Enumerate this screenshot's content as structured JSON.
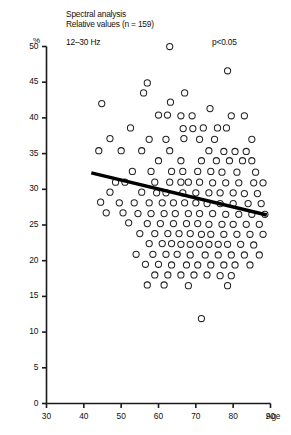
{
  "figure": {
    "title_line1": "Spectral analysis",
    "title_line2": "Relative values (n = 159)",
    "band_label": "12–30 Hz",
    "pvalue_label": "p<0.05",
    "yaxis_unit": "%",
    "xaxis_title": "Age",
    "marker_color": "#222222",
    "axis_color": "#1a1a1a",
    "fit_line_color": "#000000",
    "background": "#ffffff"
  },
  "chart_data": {
    "type": "scatter",
    "title": "Spectral analysis Relative values (n = 159)",
    "subtitle": "12–30 Hz",
    "annotation": "p<0.05",
    "xlabel": "Age",
    "ylabel": "%",
    "xlim": [
      30,
      90
    ],
    "ylim": [
      0,
      50
    ],
    "xticks": [
      30,
      40,
      50,
      60,
      70,
      80,
      90
    ],
    "yticks": [
      0,
      5,
      10,
      15,
      20,
      25,
      30,
      35,
      40,
      45,
      50
    ],
    "grid": false,
    "legend": "none",
    "n": 159,
    "marker": "open-circle",
    "fit_line": {
      "label": "linear regression",
      "x": [
        42.0,
        89.0
      ],
      "y": [
        32.3,
        26.4
      ]
    },
    "points": [
      [
        63.0,
        50.0
      ],
      [
        78.5,
        46.6
      ],
      [
        57.0,
        44.9
      ],
      [
        44.8,
        42.0
      ],
      [
        56.0,
        43.5
      ],
      [
        63.2,
        42.2
      ],
      [
        67.0,
        43.5
      ],
      [
        73.8,
        41.3
      ],
      [
        60.0,
        40.4
      ],
      [
        62.4,
        40.4
      ],
      [
        66.0,
        40.3
      ],
      [
        69.0,
        40.3
      ],
      [
        79.5,
        40.3
      ],
      [
        83.0,
        40.3
      ],
      [
        52.5,
        38.6
      ],
      [
        66.6,
        38.5
      ],
      [
        69.2,
        38.5
      ],
      [
        75.8,
        38.6
      ],
      [
        78.2,
        38.6
      ],
      [
        72.0,
        38.6
      ],
      [
        47.0,
        37.1
      ],
      [
        57.5,
        37.0
      ],
      [
        62.0,
        37.0
      ],
      [
        66.8,
        37.1
      ],
      [
        71.0,
        37.0
      ],
      [
        75.0,
        37.0
      ],
      [
        85.0,
        37.0
      ],
      [
        44.0,
        35.4
      ],
      [
        50.0,
        35.4
      ],
      [
        55.5,
        35.4
      ],
      [
        63.0,
        35.4
      ],
      [
        73.5,
        35.4
      ],
      [
        77.5,
        35.3
      ],
      [
        80.5,
        35.3
      ],
      [
        83.5,
        35.3
      ],
      [
        60.0,
        34.0
      ],
      [
        66.0,
        34.0
      ],
      [
        71.5,
        34.0
      ],
      [
        75.5,
        34.0
      ],
      [
        79.0,
        34.0
      ],
      [
        82.5,
        34.0
      ],
      [
        85.0,
        34.0
      ],
      [
        53.0,
        32.5
      ],
      [
        58.0,
        32.5
      ],
      [
        63.5,
        32.5
      ],
      [
        66.5,
        32.5
      ],
      [
        70.5,
        32.5
      ],
      [
        74.0,
        32.5
      ],
      [
        77.0,
        32.4
      ],
      [
        81.0,
        32.4
      ],
      [
        86.0,
        32.4
      ],
      [
        48.5,
        31.0
      ],
      [
        51.0,
        31.0
      ],
      [
        59.0,
        31.0
      ],
      [
        63.0,
        31.0
      ],
      [
        66.0,
        31.0
      ],
      [
        68.0,
        31.0
      ],
      [
        71.0,
        31.0
      ],
      [
        74.5,
        30.9
      ],
      [
        78.0,
        30.9
      ],
      [
        81.5,
        30.9
      ],
      [
        85.5,
        30.9
      ],
      [
        88.0,
        30.9
      ],
      [
        47.0,
        29.6
      ],
      [
        55.5,
        29.6
      ],
      [
        59.5,
        29.5
      ],
      [
        62.0,
        29.5
      ],
      [
        66.5,
        29.5
      ],
      [
        70.0,
        29.5
      ],
      [
        73.5,
        29.5
      ],
      [
        76.5,
        29.5
      ],
      [
        80.0,
        29.5
      ],
      [
        83.0,
        29.4
      ],
      [
        86.5,
        29.4
      ],
      [
        44.5,
        28.2
      ],
      [
        49.5,
        28.1
      ],
      [
        53.5,
        28.1
      ],
      [
        57.5,
        28.1
      ],
      [
        61.0,
        28.1
      ],
      [
        64.0,
        28.1
      ],
      [
        67.0,
        28.1
      ],
      [
        70.0,
        28.1
      ],
      [
        73.0,
        28.0
      ],
      [
        76.5,
        28.0
      ],
      [
        80.0,
        28.0
      ],
      [
        84.0,
        28.0
      ],
      [
        87.5,
        28.0
      ],
      [
        46.0,
        26.7
      ],
      [
        50.5,
        26.7
      ],
      [
        54.5,
        26.6
      ],
      [
        58.0,
        26.6
      ],
      [
        61.5,
        26.6
      ],
      [
        64.5,
        26.6
      ],
      [
        68.0,
        26.6
      ],
      [
        71.0,
        26.6
      ],
      [
        74.5,
        26.6
      ],
      [
        78.0,
        26.5
      ],
      [
        81.5,
        26.5
      ],
      [
        85.0,
        26.5
      ],
      [
        88.5,
        26.5
      ],
      [
        52.0,
        25.3
      ],
      [
        57.0,
        25.2
      ],
      [
        60.5,
        25.2
      ],
      [
        64.0,
        25.2
      ],
      [
        67.5,
        25.2
      ],
      [
        70.5,
        25.2
      ],
      [
        73.5,
        25.1
      ],
      [
        77.0,
        25.1
      ],
      [
        80.0,
        25.1
      ],
      [
        83.5,
        25.1
      ],
      [
        87.0,
        25.1
      ],
      [
        55.0,
        23.8
      ],
      [
        59.0,
        23.8
      ],
      [
        62.5,
        23.8
      ],
      [
        65.5,
        23.8
      ],
      [
        68.5,
        23.8
      ],
      [
        71.5,
        23.7
      ],
      [
        74.0,
        23.7
      ],
      [
        77.5,
        23.7
      ],
      [
        81.0,
        23.7
      ],
      [
        84.5,
        23.7
      ],
      [
        88.0,
        23.7
      ],
      [
        57.5,
        22.4
      ],
      [
        61.0,
        22.4
      ],
      [
        63.5,
        22.4
      ],
      [
        66.0,
        22.3
      ],
      [
        68.5,
        22.3
      ],
      [
        71.0,
        22.3
      ],
      [
        73.5,
        22.3
      ],
      [
        76.0,
        22.3
      ],
      [
        78.5,
        22.3
      ],
      [
        82.0,
        22.3
      ],
      [
        85.5,
        22.2
      ],
      [
        54.0,
        20.9
      ],
      [
        58.5,
        20.9
      ],
      [
        62.0,
        20.9
      ],
      [
        65.0,
        20.9
      ],
      [
        68.5,
        20.8
      ],
      [
        72.5,
        20.8
      ],
      [
        76.0,
        20.8
      ],
      [
        79.5,
        20.8
      ],
      [
        83.0,
        20.8
      ],
      [
        87.0,
        20.8
      ],
      [
        56.5,
        19.5
      ],
      [
        60.0,
        19.5
      ],
      [
        63.5,
        19.4
      ],
      [
        67.5,
        19.4
      ],
      [
        70.5,
        19.4
      ],
      [
        74.0,
        19.4
      ],
      [
        77.5,
        19.4
      ],
      [
        80.5,
        19.4
      ],
      [
        84.5,
        19.4
      ],
      [
        59.0,
        18.0
      ],
      [
        62.5,
        18.0
      ],
      [
        66.0,
        18.0
      ],
      [
        69.5,
        18.0
      ],
      [
        73.0,
        18.0
      ],
      [
        76.5,
        17.9
      ],
      [
        79.5,
        17.9
      ],
      [
        61.5,
        16.6
      ],
      [
        68.0,
        16.5
      ],
      [
        78.5,
        16.5
      ],
      [
        57.0,
        16.6
      ],
      [
        71.5,
        11.9
      ]
    ]
  }
}
